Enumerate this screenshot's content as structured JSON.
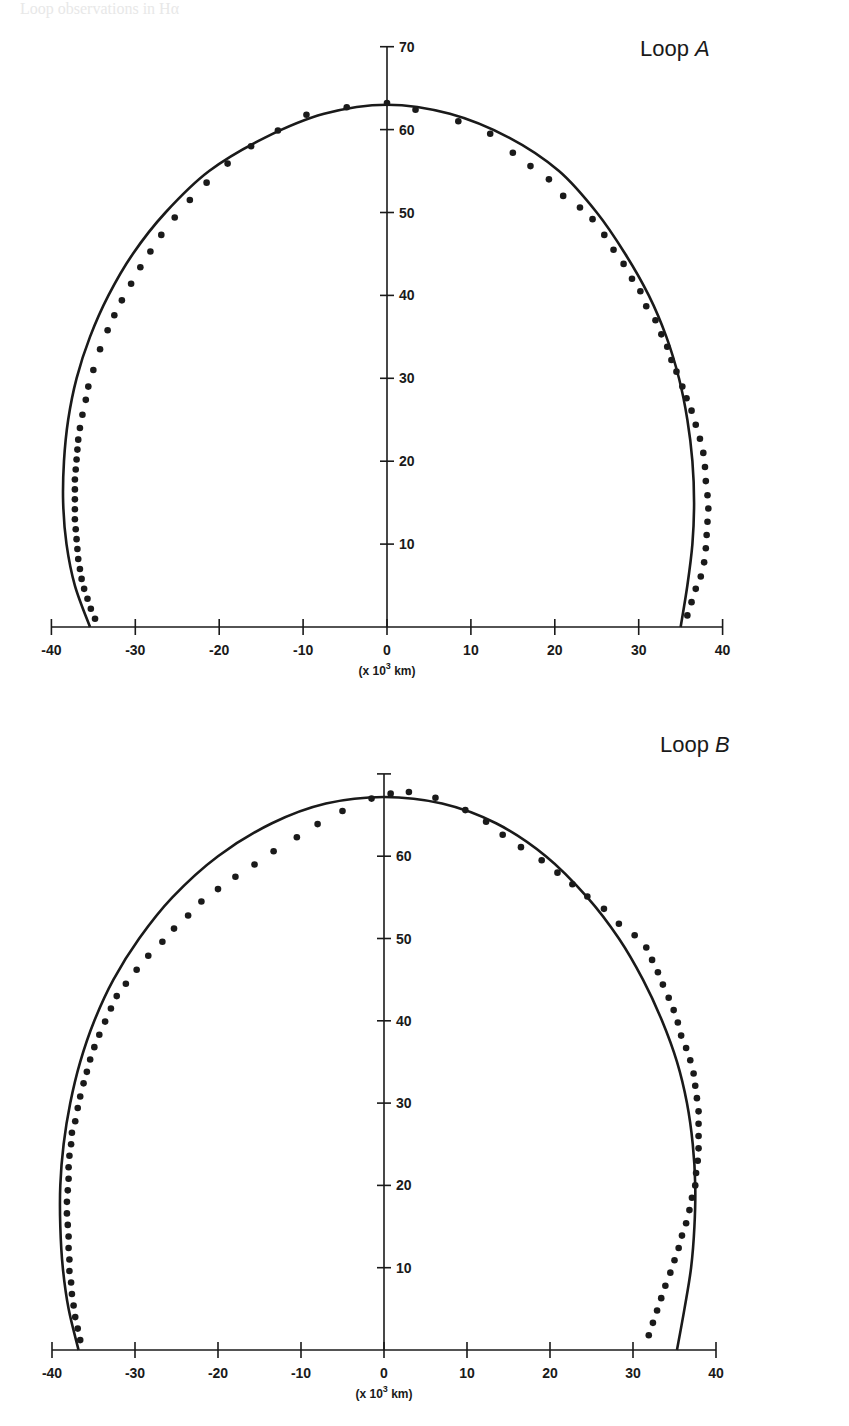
{
  "page": {
    "header_fragment": "Loop observations in Hα"
  },
  "chart_data": [
    {
      "type": "scatter",
      "title": "Loop A",
      "title_prefix": "Loop ",
      "title_italic": "A",
      "xlabel": "(x 10³ km)",
      "xlabel_parts": {
        "pre": "(x 10",
        "sup": "3",
        "post": " km)"
      },
      "ylabel": "",
      "xlim": [
        -40,
        40
      ],
      "ylim": [
        0,
        70
      ],
      "x_ticks": [
        -40,
        -30,
        -20,
        -10,
        0,
        10,
        20,
        30,
        40
      ],
      "x_tick_labels": [
        "-40",
        "-30",
        "-20",
        "-10",
        "0",
        "10",
        "20",
        "30",
        "40"
      ],
      "y_ticks": [
        10,
        20,
        30,
        40,
        50,
        60,
        70
      ],
      "y_tick_labels": [
        "10",
        "20",
        "30",
        "40",
        "50",
        "60",
        "70"
      ],
      "grid": false,
      "legend": "none",
      "series": [
        {
          "name": "model curve",
          "kind": "line",
          "color": "#1a1a1a",
          "points": [
            [
              -35.4,
              0
            ],
            [
              -37.2,
              5
            ],
            [
              -38.2,
              10
            ],
            [
              -38.6,
              15
            ],
            [
              -38.5,
              20
            ],
            [
              -38.0,
              25
            ],
            [
              -37.0,
              30
            ],
            [
              -35.4,
              35
            ],
            [
              -33.2,
              40
            ],
            [
              -30.3,
              45
            ],
            [
              -26.4,
              50
            ],
            [
              -21.2,
              55
            ],
            [
              -14.6,
              59
            ],
            [
              -7.5,
              61.9
            ],
            [
              0,
              63
            ],
            [
              7.5,
              61.9
            ],
            [
              14.6,
              59
            ],
            [
              20.5,
              55
            ],
            [
              25.0,
              50
            ],
            [
              28.4,
              45
            ],
            [
              31.2,
              40
            ],
            [
              33.3,
              35
            ],
            [
              34.8,
              30
            ],
            [
              35.8,
              25
            ],
            [
              36.4,
              20
            ],
            [
              36.6,
              15
            ],
            [
              36.4,
              10
            ],
            [
              35.8,
              5
            ],
            [
              35.0,
              0
            ]
          ]
        },
        {
          "name": "observed points",
          "kind": "scatter",
          "color": "#1a1a1a",
          "points": [
            [
              -34.8,
              1
            ],
            [
              -35.3,
              2.2
            ],
            [
              -35.7,
              3.4
            ],
            [
              -36.1,
              4.6
            ],
            [
              -36.4,
              5.8
            ],
            [
              -36.6,
              7.0
            ],
            [
              -36.8,
              8.2
            ],
            [
              -36.9,
              9.4
            ],
            [
              -37.0,
              10.6
            ],
            [
              -37.1,
              11.8
            ],
            [
              -37.2,
              13.0
            ],
            [
              -37.2,
              14.2
            ],
            [
              -37.2,
              15.4
            ],
            [
              -37.2,
              16.6
            ],
            [
              -37.2,
              17.8
            ],
            [
              -37.1,
              19.0
            ],
            [
              -37.0,
              20.2
            ],
            [
              -36.9,
              21.4
            ],
            [
              -36.8,
              22.6
            ],
            [
              -36.6,
              24.0
            ],
            [
              -36.3,
              25.6
            ],
            [
              -35.9,
              27.4
            ],
            [
              -35.6,
              29.0
            ],
            [
              -35.0,
              31.0
            ],
            [
              -34.2,
              33.5
            ],
            [
              -33.3,
              35.8
            ],
            [
              -32.5,
              37.6
            ],
            [
              -31.6,
              39.4
            ],
            [
              -30.5,
              41.4
            ],
            [
              -29.4,
              43.4
            ],
            [
              -28.2,
              45.3
            ],
            [
              -26.9,
              47.3
            ],
            [
              -25.3,
              49.4
            ],
            [
              -23.5,
              51.5
            ],
            [
              -21.5,
              53.6
            ],
            [
              -19.0,
              55.9
            ],
            [
              -16.2,
              58.0
            ],
            [
              -13.0,
              59.9
            ],
            [
              -9.6,
              61.8
            ],
            [
              -4.8,
              62.7
            ],
            [
              0,
              63.2
            ],
            [
              3.4,
              62.4
            ],
            [
              8.5,
              61.0
            ],
            [
              12.3,
              59.5
            ],
            [
              15.0,
              57.2
            ],
            [
              17.1,
              55.6
            ],
            [
              19.3,
              54.0
            ],
            [
              21.0,
              52.0
            ],
            [
              23.0,
              50.6
            ],
            [
              24.5,
              49.2
            ],
            [
              25.9,
              47.3
            ],
            [
              27.0,
              45.5
            ],
            [
              28.2,
              43.8
            ],
            [
              29.2,
              42.0
            ],
            [
              30.2,
              40.5
            ],
            [
              30.9,
              38.7
            ],
            [
              32.0,
              37.0
            ],
            [
              32.7,
              35.3
            ],
            [
              33.4,
              33.8
            ],
            [
              33.9,
              32.2
            ],
            [
              34.5,
              30.8
            ],
            [
              35.2,
              29.0
            ],
            [
              35.7,
              27.6
            ],
            [
              36.3,
              26.1
            ],
            [
              36.8,
              24.4
            ],
            [
              37.3,
              22.7
            ],
            [
              37.7,
              21.0
            ],
            [
              37.9,
              19.3
            ],
            [
              38.0,
              17.6
            ],
            [
              38.2,
              15.9
            ],
            [
              38.3,
              14.3
            ],
            [
              38.2,
              12.7
            ],
            [
              38.1,
              11.1
            ],
            [
              38.0,
              9.5
            ],
            [
              37.8,
              7.8
            ],
            [
              37.4,
              6.1
            ],
            [
              36.8,
              4.6
            ],
            [
              36.3,
              3.0
            ],
            [
              35.8,
              1.4
            ]
          ]
        }
      ]
    },
    {
      "type": "scatter",
      "title": "Loop B",
      "title_prefix": "Loop ",
      "title_italic": "B",
      "xlabel": "(x 10³ km)",
      "xlabel_parts": {
        "pre": "(x 10",
        "sup": "3",
        "post": " km)"
      },
      "ylabel": "",
      "xlim": [
        -40,
        40
      ],
      "ylim": [
        0,
        70
      ],
      "x_ticks": [
        -40,
        -30,
        -20,
        -10,
        0,
        10,
        20,
        30,
        40
      ],
      "x_tick_labels": [
        "-40",
        "-30",
        "-20",
        "-10",
        "0",
        "10",
        "20",
        "30",
        "40"
      ],
      "y_ticks": [
        10,
        20,
        30,
        40,
        50,
        60,
        70
      ],
      "y_tick_labels": [
        "10",
        "20",
        "30",
        "40",
        "50",
        "60",
        ""
      ],
      "grid": false,
      "legend": "none",
      "series": [
        {
          "name": "model curve",
          "kind": "line",
          "color": "#1a1a1a",
          "points": [
            [
              -36.8,
              0
            ],
            [
              -38.0,
              5
            ],
            [
              -38.7,
              10
            ],
            [
              -39.0,
              15
            ],
            [
              -39.0,
              20
            ],
            [
              -38.6,
              25
            ],
            [
              -37.8,
              30
            ],
            [
              -36.6,
              35
            ],
            [
              -34.9,
              40
            ],
            [
              -32.6,
              45
            ],
            [
              -29.5,
              50
            ],
            [
              -25.5,
              55
            ],
            [
              -20.0,
              60
            ],
            [
              -13.5,
              64
            ],
            [
              -7.0,
              66.4
            ],
            [
              0,
              67.2
            ],
            [
              7.0,
              66.4
            ],
            [
              13.5,
              64
            ],
            [
              19.5,
              60
            ],
            [
              24.5,
              55
            ],
            [
              28.3,
              50
            ],
            [
              31.2,
              45
            ],
            [
              33.5,
              40
            ],
            [
              35.3,
              35
            ],
            [
              36.5,
              30
            ],
            [
              37.2,
              25
            ],
            [
              37.5,
              20
            ],
            [
              37.4,
              15
            ],
            [
              37.0,
              10
            ],
            [
              36.2,
              5
            ],
            [
              35.3,
              0
            ]
          ]
        },
        {
          "name": "observed points",
          "kind": "scatter",
          "color": "#1a1a1a",
          "points": [
            [
              -36.6,
              1.2
            ],
            [
              -36.9,
              2.6
            ],
            [
              -37.2,
              4.0
            ],
            [
              -37.4,
              5.4
            ],
            [
              -37.6,
              6.8
            ],
            [
              -37.7,
              8.2
            ],
            [
              -37.9,
              9.6
            ],
            [
              -37.9,
              11.0
            ],
            [
              -38.0,
              12.4
            ],
            [
              -38.0,
              13.8
            ],
            [
              -38.1,
              15.2
            ],
            [
              -38.2,
              16.6
            ],
            [
              -38.2,
              18.0
            ],
            [
              -38.1,
              19.4
            ],
            [
              -38.0,
              20.8
            ],
            [
              -38.0,
              22.2
            ],
            [
              -37.9,
              23.6
            ],
            [
              -37.7,
              25.0
            ],
            [
              -37.6,
              26.4
            ],
            [
              -37.2,
              27.8
            ],
            [
              -36.9,
              29.4
            ],
            [
              -36.6,
              30.8
            ],
            [
              -36.2,
              32.4
            ],
            [
              -35.8,
              33.8
            ],
            [
              -35.4,
              35.3
            ],
            [
              -34.9,
              36.8
            ],
            [
              -34.3,
              38.3
            ],
            [
              -33.6,
              39.9
            ],
            [
              -32.9,
              41.5
            ],
            [
              -32.2,
              43.0
            ],
            [
              -31.1,
              44.5
            ],
            [
              -29.8,
              46.2
            ],
            [
              -28.4,
              47.9
            ],
            [
              -26.7,
              49.6
            ],
            [
              -25.3,
              51.2
            ],
            [
              -23.6,
              52.8
            ],
            [
              -22.0,
              54.5
            ],
            [
              -20.0,
              56.0
            ],
            [
              -17.9,
              57.5
            ],
            [
              -15.6,
              59.0
            ],
            [
              -13.3,
              60.6
            ],
            [
              -10.5,
              62.3
            ],
            [
              -8.0,
              63.9
            ],
            [
              -5.0,
              65.5
            ],
            [
              -1.5,
              67.0
            ],
            [
              0.8,
              67.6
            ],
            [
              3.0,
              67.8
            ],
            [
              6.2,
              67.1
            ],
            [
              9.8,
              65.6
            ],
            [
              12.3,
              64.2
            ],
            [
              14.3,
              62.6
            ],
            [
              16.5,
              61.1
            ],
            [
              19.0,
              59.5
            ],
            [
              20.9,
              58.0
            ],
            [
              22.7,
              56.6
            ],
            [
              24.5,
              55.1
            ],
            [
              26.5,
              53.6
            ],
            [
              28.3,
              51.8
            ],
            [
              30.2,
              50.4
            ],
            [
              31.6,
              48.9
            ],
            [
              32.3,
              47.4
            ],
            [
              33.0,
              45.9
            ],
            [
              33.6,
              44.4
            ],
            [
              34.3,
              42.8
            ],
            [
              34.9,
              41.3
            ],
            [
              35.4,
              39.8
            ],
            [
              35.8,
              38.2
            ],
            [
              36.4,
              36.7
            ],
            [
              36.9,
              35.2
            ],
            [
              37.3,
              33.6
            ],
            [
              37.5,
              32.1
            ],
            [
              37.7,
              30.6
            ],
            [
              37.9,
              29.0
            ],
            [
              37.9,
              27.5
            ],
            [
              37.9,
              26.0
            ],
            [
              37.9,
              24.5
            ],
            [
              37.8,
              23.0
            ],
            [
              37.6,
              21.5
            ],
            [
              37.5,
              20.0
            ],
            [
              37.1,
              18.5
            ],
            [
              36.8,
              17.0
            ],
            [
              36.4,
              15.4
            ],
            [
              35.9,
              13.9
            ],
            [
              35.5,
              12.4
            ],
            [
              35.0,
              10.9
            ],
            [
              34.5,
              9.4
            ],
            [
              33.9,
              7.8
            ],
            [
              33.4,
              6.3
            ],
            [
              32.9,
              4.8
            ],
            [
              32.4,
              3.3
            ],
            [
              31.9,
              1.8
            ]
          ]
        }
      ]
    }
  ],
  "plots": {
    "loop_a": {
      "title_prefix": "Loop ",
      "title_italic": "A",
      "unit_pre": "(x 10",
      "unit_sup": "3",
      "unit_post": " km)"
    },
    "loop_b": {
      "title_prefix": "Loop ",
      "title_italic": "B",
      "unit_pre": "(x 10",
      "unit_sup": "3",
      "unit_post": " km)"
    }
  }
}
